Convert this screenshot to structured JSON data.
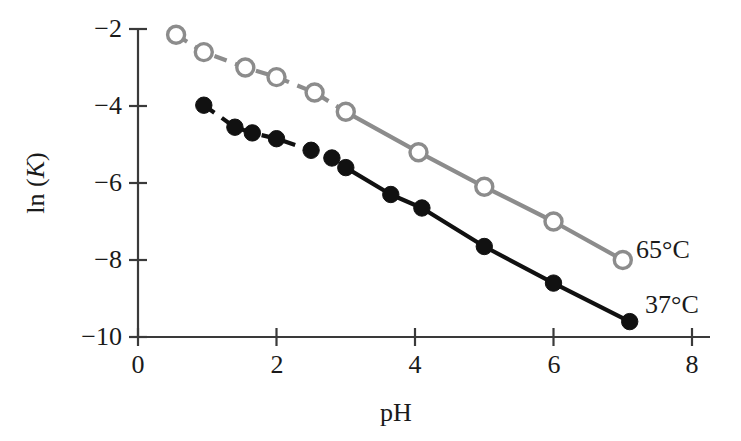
{
  "figure": {
    "background_color": "#ffffff",
    "width": 741,
    "height": 441
  },
  "axes": {
    "x_title": "pH",
    "y_title_prefix": "ln (",
    "y_title_var": "K",
    "y_title_suffix": ")",
    "x_ticks": [
      "0",
      "2",
      "4",
      "6",
      "8"
    ],
    "y_ticks": [
      "−2",
      "−4",
      "−6",
      "−8",
      "−10"
    ],
    "axis_color": "#3a3a3a",
    "grid": "off"
  },
  "series_labels": {
    "hot": "65°C",
    "cold": "37°C"
  },
  "colors": {
    "hot_series": "#8c8c8c",
    "cold_series": "#111111",
    "text": "#1a1a1a"
  },
  "chart_data": {
    "type": "scatter",
    "title": "",
    "xlabel": "pH",
    "ylabel": "ln (K)",
    "xlim": [
      0,
      8
    ],
    "ylim": [
      -10,
      -2
    ],
    "x_ticks": [
      0,
      2,
      4,
      6,
      8
    ],
    "y_ticks": [
      -2,
      -4,
      -6,
      -8,
      -10
    ],
    "grid": false,
    "legend": "inline labels at right end of each series",
    "series": [
      {
        "name": "65°C",
        "marker": "open-circle",
        "color": "#8c8c8c",
        "line_style_early": "dashed",
        "line_style_late": "solid",
        "dash_solid_transition_ph": 2.6,
        "points": [
          {
            "ph": 0.55,
            "lnK": -2.15
          },
          {
            "ph": 0.95,
            "lnK": -2.6
          },
          {
            "ph": 1.55,
            "lnK": -3.0
          },
          {
            "ph": 2.0,
            "lnK": -3.25
          },
          {
            "ph": 2.55,
            "lnK": -3.65
          },
          {
            "ph": 3.0,
            "lnK": -4.15
          },
          {
            "ph": 4.05,
            "lnK": -5.2
          },
          {
            "ph": 5.0,
            "lnK": -6.1
          },
          {
            "ph": 6.0,
            "lnK": -7.0
          },
          {
            "ph": 7.0,
            "lnK": -8.0
          }
        ]
      },
      {
        "name": "37°C",
        "marker": "filled-circle",
        "color": "#111111",
        "line_style_early": "dashed",
        "line_style_late": "solid",
        "dash_solid_transition_ph": 2.8,
        "points": [
          {
            "ph": 0.95,
            "lnK": -3.98
          },
          {
            "ph": 1.4,
            "lnK": -4.55
          },
          {
            "ph": 1.65,
            "lnK": -4.7
          },
          {
            "ph": 2.0,
            "lnK": -4.85
          },
          {
            "ph": 2.5,
            "lnK": -5.15
          },
          {
            "ph": 2.8,
            "lnK": -5.35
          },
          {
            "ph": 3.0,
            "lnK": -5.6
          },
          {
            "ph": 3.65,
            "lnK": -6.3
          },
          {
            "ph": 4.1,
            "lnK": -6.65
          },
          {
            "ph": 5.0,
            "lnK": -7.65
          },
          {
            "ph": 6.0,
            "lnK": -8.6
          },
          {
            "ph": 7.1,
            "lnK": -9.6
          }
        ]
      }
    ]
  }
}
